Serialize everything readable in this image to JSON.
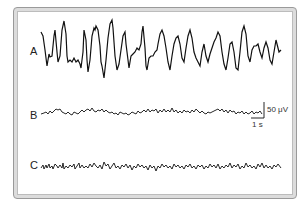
{
  "figure": {
    "panels": [
      {
        "label": "A",
        "description": "high-amplitude rhythmic EEG trace"
      },
      {
        "label": "B",
        "description": "low-amplitude EEG trace"
      },
      {
        "label": "C",
        "description": "low-amplitude fast-activity EEG trace"
      }
    ],
    "scale_bar": {
      "amplitude_label": "50 μV",
      "time_label": "1 s"
    },
    "colors": {
      "trace": "#111111",
      "frame": "#9a9a9a",
      "background": "#ffffff"
    }
  }
}
